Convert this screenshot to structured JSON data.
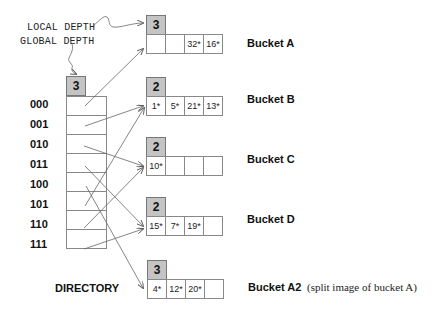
{
  "annotations": {
    "local_depth": "LOCAL DEPTH",
    "global_depth": "GLOBAL DEPTH"
  },
  "directory": {
    "label": "DIRECTORY",
    "global_depth": "3",
    "entries": [
      {
        "index": "000",
        "points_to": "Bucket A"
      },
      {
        "index": "001",
        "points_to": "Bucket B"
      },
      {
        "index": "010",
        "points_to": "Bucket C"
      },
      {
        "index": "011",
        "points_to": "Bucket D"
      },
      {
        "index": "100",
        "points_to": "Bucket A2"
      },
      {
        "index": "101",
        "points_to": "Bucket B"
      },
      {
        "index": "110",
        "points_to": "Bucket C"
      },
      {
        "index": "111",
        "points_to": "Bucket D"
      }
    ]
  },
  "buckets": [
    {
      "name": "Bucket A",
      "local_depth": "3",
      "cells": [
        "",
        "",
        "32*",
        "16*"
      ]
    },
    {
      "name": "Bucket B",
      "local_depth": "2",
      "cells": [
        "1*",
        "5*",
        "21*",
        "13*"
      ]
    },
    {
      "name": "Bucket C",
      "local_depth": "2",
      "cells": [
        "10*",
        "",
        "",
        ""
      ]
    },
    {
      "name": "Bucket D",
      "local_depth": "2",
      "cells": [
        "15*",
        "7*",
        "19*",
        ""
      ]
    },
    {
      "name": "Bucket A2",
      "local_depth": "3",
      "cells": [
        "4*",
        "12*",
        "20*",
        ""
      ],
      "note": "(split image of bucket A)"
    }
  ]
}
